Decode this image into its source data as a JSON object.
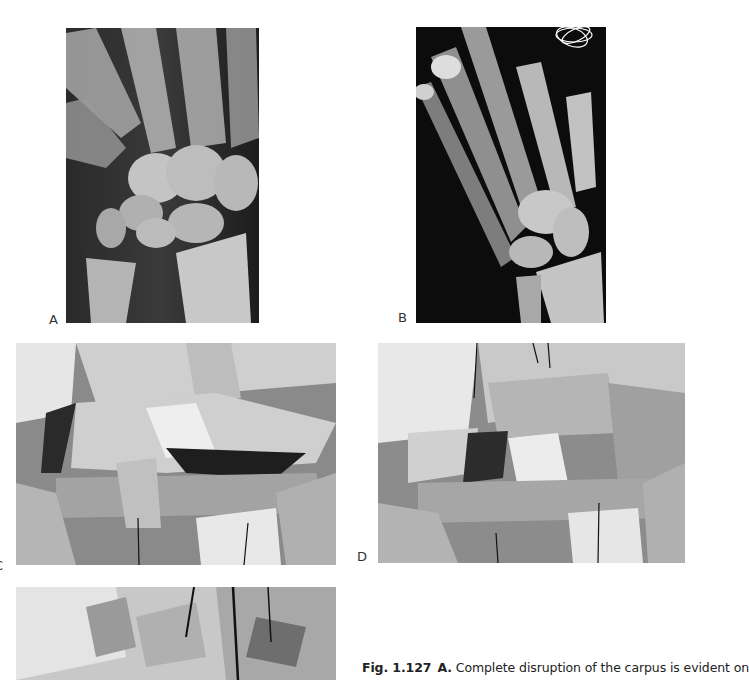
{
  "figure": {
    "panels": [
      {
        "id": "A",
        "label": "A",
        "kind": "radiograph",
        "description": "PA radiograph of wrist showing carpal disruption"
      },
      {
        "id": "B",
        "label": "B",
        "kind": "radiograph",
        "description": "Oblique radiograph of hand and wrist"
      },
      {
        "id": "C",
        "label": "C",
        "kind": "surgical-photo",
        "description": "Intraoperative photograph of carpus"
      },
      {
        "id": "D",
        "label": "D",
        "kind": "surgical-photo",
        "description": "Intraoperative photograph with sutures"
      },
      {
        "id": "E",
        "label": "E",
        "kind": "surgical-photo",
        "description": "Intraoperative photograph (partially visible)"
      }
    ],
    "caption": {
      "fig_number": "Fig. 1.127",
      "part_label": "A.",
      "text": " Complete disruption of the carpus is evident on"
    }
  }
}
